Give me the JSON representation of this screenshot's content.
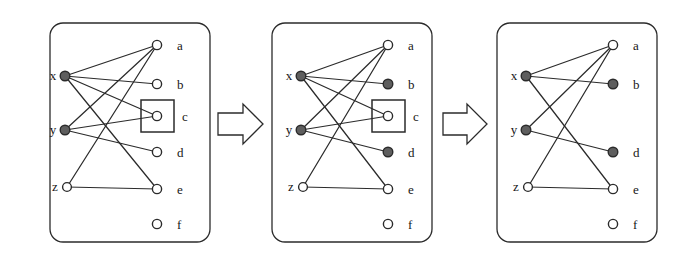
{
  "figure": {
    "panel_count": 3,
    "colors": {
      "stroke": "#2b2b2b",
      "filled_node": "#5e5e5e",
      "open_node": "#ffffff",
      "background": "#ffffff",
      "label": "#161616"
    },
    "panels": [
      {
        "id": "panel-1",
        "left_labels": [
          "x",
          "y",
          "z"
        ],
        "right_labels": [
          "a",
          "b",
          "c",
          "d",
          "e",
          "f"
        ],
        "left_nodes": [
          {
            "label": "x",
            "state": "filled"
          },
          {
            "label": "y",
            "state": "filled"
          },
          {
            "label": "z",
            "state": "open"
          }
        ],
        "right_nodes": [
          {
            "label": "a",
            "state": "open"
          },
          {
            "label": "b",
            "state": "open"
          },
          {
            "label": "c",
            "state": "open"
          },
          {
            "label": "d",
            "state": "open"
          },
          {
            "label": "e",
            "state": "open"
          },
          {
            "label": "f",
            "state": "open"
          }
        ],
        "edges": [
          {
            "from": "x",
            "to": "a"
          },
          {
            "from": "x",
            "to": "b"
          },
          {
            "from": "x",
            "to": "c"
          },
          {
            "from": "x",
            "to": "e"
          },
          {
            "from": "y",
            "to": "a"
          },
          {
            "from": "y",
            "to": "c"
          },
          {
            "from": "y",
            "to": "d"
          },
          {
            "from": "z",
            "to": "a"
          },
          {
            "from": "z",
            "to": "e"
          }
        ],
        "highlight_box": "c"
      },
      {
        "id": "panel-2",
        "left_labels": [
          "x",
          "y",
          "z"
        ],
        "right_labels": [
          "a",
          "b",
          "c",
          "d",
          "e",
          "f"
        ],
        "left_nodes": [
          {
            "label": "x",
            "state": "filled"
          },
          {
            "label": "y",
            "state": "filled"
          },
          {
            "label": "z",
            "state": "open"
          }
        ],
        "right_nodes": [
          {
            "label": "a",
            "state": "open"
          },
          {
            "label": "b",
            "state": "filled"
          },
          {
            "label": "c",
            "state": "open"
          },
          {
            "label": "d",
            "state": "filled"
          },
          {
            "label": "e",
            "state": "open"
          },
          {
            "label": "f",
            "state": "open"
          }
        ],
        "edges": [
          {
            "from": "x",
            "to": "a"
          },
          {
            "from": "x",
            "to": "b"
          },
          {
            "from": "x",
            "to": "c"
          },
          {
            "from": "x",
            "to": "e"
          },
          {
            "from": "y",
            "to": "a"
          },
          {
            "from": "y",
            "to": "c"
          },
          {
            "from": "y",
            "to": "d"
          },
          {
            "from": "z",
            "to": "a"
          },
          {
            "from": "z",
            "to": "e"
          }
        ],
        "highlight_box": "c"
      },
      {
        "id": "panel-3",
        "left_labels": [
          "x",
          "y",
          "z"
        ],
        "right_labels": [
          "a",
          "b",
          "d",
          "e",
          "f"
        ],
        "left_nodes": [
          {
            "label": "x",
            "state": "filled"
          },
          {
            "label": "y",
            "state": "filled"
          },
          {
            "label": "z",
            "state": "open"
          }
        ],
        "right_nodes": [
          {
            "label": "a",
            "state": "open"
          },
          {
            "label": "b",
            "state": "filled"
          },
          {
            "label": "d",
            "state": "filled"
          },
          {
            "label": "e",
            "state": "open"
          },
          {
            "label": "f",
            "state": "open"
          }
        ],
        "edges": [
          {
            "from": "x",
            "to": "a"
          },
          {
            "from": "x",
            "to": "b"
          },
          {
            "from": "x",
            "to": "e"
          },
          {
            "from": "y",
            "to": "a"
          },
          {
            "from": "y",
            "to": "d"
          },
          {
            "from": "z",
            "to": "a"
          },
          {
            "from": "z",
            "to": "e"
          }
        ],
        "highlight_box": null
      }
    ],
    "arrows": [
      {
        "id": "arrow-1",
        "direction": "right"
      },
      {
        "id": "arrow-2",
        "direction": "right"
      }
    ]
  }
}
